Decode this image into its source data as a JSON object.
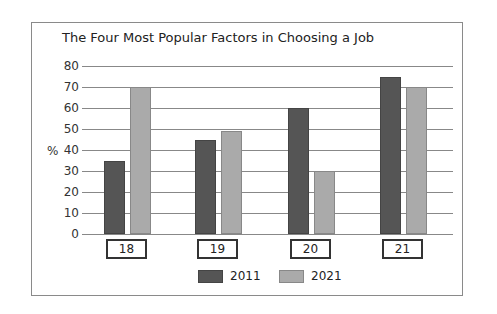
{
  "chart_data": {
    "type": "bar",
    "title": "The Four Most Popular Factors in Choosing a Job",
    "xlabel": "",
    "ylabel": "%",
    "ylim": [
      0,
      80
    ],
    "yticks": [
      0,
      10,
      20,
      30,
      40,
      50,
      60,
      70,
      80
    ],
    "grid": true,
    "legend_position": "bottom",
    "categories": [
      "18",
      "19",
      "20",
      "21"
    ],
    "series": [
      {
        "name": "2011",
        "color": "#555555",
        "values": [
          35,
          45,
          60,
          75
        ]
      },
      {
        "name": "2021",
        "color": "#aaaaaa",
        "values": [
          70,
          49,
          30,
          70
        ]
      }
    ]
  }
}
